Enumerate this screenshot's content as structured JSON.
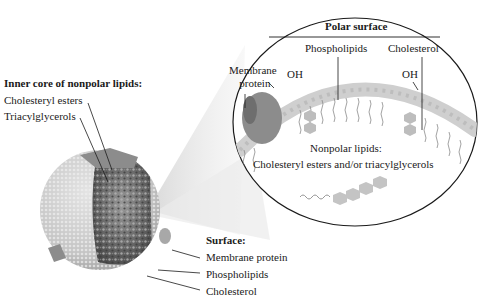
{
  "figure": {
    "type": "lipoprotein-structure-diagram",
    "colors": {
      "background": "#ffffff",
      "surface_phospholipid": "#d2d2d2",
      "membrane_protein": "#8c8c8c",
      "core": "#6e6e6e",
      "outline": "#1a1a1a",
      "magnifier_rays": "#e6e6e6"
    }
  },
  "inner_core": {
    "heading": "Inner core of nonpolar lipids:",
    "items": [
      {
        "label": "Cholesteryl esters"
      },
      {
        "label": "Triacylglycerols"
      }
    ]
  },
  "surface": {
    "heading": "Surface:",
    "items": [
      {
        "label": "Membrane protein"
      },
      {
        "label": "Phospholipids"
      },
      {
        "label": "Cholesterol"
      }
    ]
  },
  "magnified": {
    "polar_heading": "Polar surface",
    "phospholipids_label": "Phospholipids",
    "cholesterol_label": "Cholesterol",
    "membrane_protein_label_line1": "Membrane",
    "membrane_protein_label_line2": "protein",
    "oh_left": "OH",
    "oh_right": "OH",
    "nonpolar_line1": "Nonpolar lipids:",
    "nonpolar_line2": "Cholesteryl esters and/or triacylglycerols"
  }
}
